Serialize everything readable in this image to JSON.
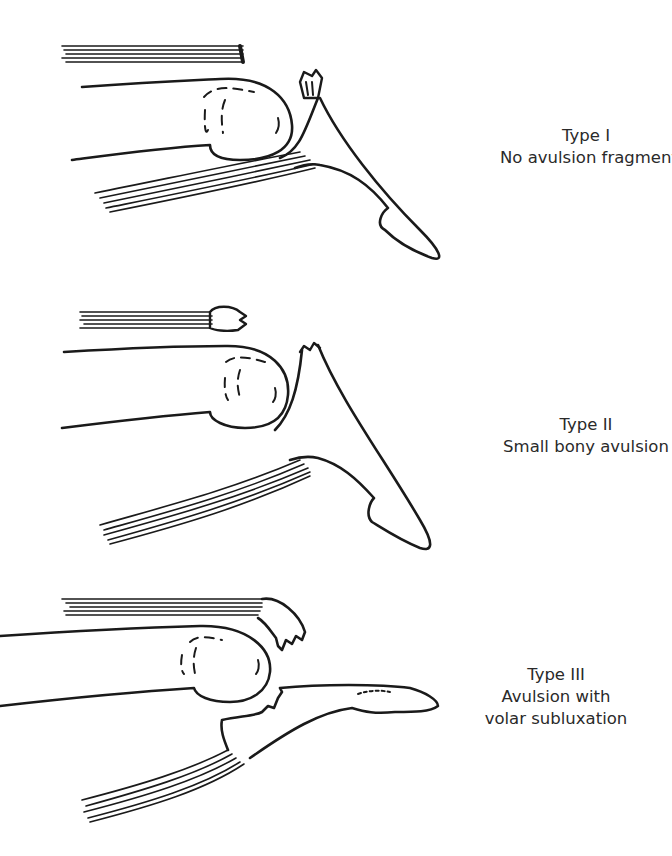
{
  "figure": {
    "panels": [
      {
        "id": "type-1",
        "title": "Type I",
        "caption": [
          "No avulsion fragment"
        ]
      },
      {
        "id": "type-2",
        "title": "Type II",
        "caption": [
          "Small bony avulsion"
        ]
      },
      {
        "id": "type-3",
        "title": "Type III",
        "caption": [
          "Avulsion with",
          "volar subluxation"
        ]
      }
    ],
    "colors": {
      "ink": "#1a1a1a",
      "background": "#ffffff",
      "text": "#2a2a2a"
    }
  }
}
